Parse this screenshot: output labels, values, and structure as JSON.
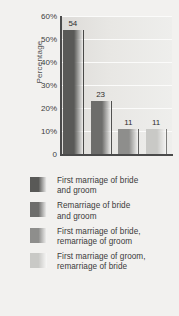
{
  "chart_data": {
    "type": "bar",
    "title": "",
    "subtitle": "",
    "xlabel": "",
    "ylabel": "Percentage",
    "ylim": [
      0,
      60
    ],
    "grid": true,
    "legend_position": "below",
    "categories": [
      "First marriage of bride and groom",
      "Remarriage of bride and groom",
      "First marriage of bride, remarriage of groom",
      "First marriage of groom, remarriage of bride"
    ],
    "values": [
      54,
      23,
      11,
      11
    ],
    "value_labels": [
      "54",
      "23",
      "11",
      "11"
    ],
    "ytick_labels": [
      "60%",
      "50%",
      "40%",
      "30%",
      "20%",
      "10%",
      "0"
    ],
    "ytick_values": [
      60,
      50,
      40,
      30,
      20,
      10,
      0
    ],
    "series": [
      {
        "name": "Percentage",
        "values": [
          54,
          23,
          11,
          11
        ]
      }
    ],
    "bar_colors": [
      "#595957",
      "#6d6d6b",
      "#8e8e8c",
      "#c9c9c6"
    ]
  },
  "legend": {
    "items": [
      {
        "label": "First marriage of bride\nand groom",
        "color": "#595957",
        "value": 54
      },
      {
        "label": "Remarriage of bride\nand groom",
        "color": "#6d6d6b",
        "value": 23
      },
      {
        "label": "First marriage of bride,\nremarriage of groom",
        "color": "#8e8e8c",
        "value": 11
      },
      {
        "label": "First marriage of groom,\nremarriage of bride",
        "color": "#c9c9c6",
        "value": 11
      }
    ]
  },
  "colors": {
    "background": "#f2f1ef",
    "plot_background": "#e4e3e0",
    "gridline": "#fbfbfa",
    "axis": "#4a4a4a",
    "text": "#3b3b3b"
  }
}
